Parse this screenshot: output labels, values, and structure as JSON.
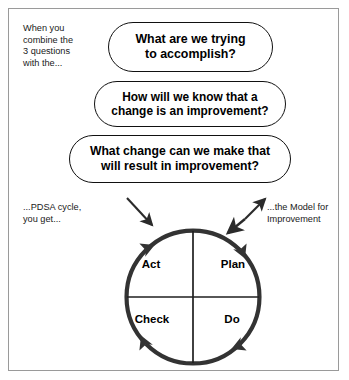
{
  "diagram": {
    "title_notes": {
      "intro": "When you\ncombine the\n3 questions\nwith the...",
      "pdsa": "...PDSA cycle,\nyou get...",
      "model": "...the Model for\nImprovement"
    },
    "questions": [
      {
        "id": "q1",
        "text": "What are we trying\nto accomplish?"
      },
      {
        "id": "q2",
        "text": "How will we know that a\nchange is an improvement?"
      },
      {
        "id": "q3",
        "text": "What change can we make that\nwill result in improvement?"
      }
    ],
    "cycle": {
      "name": "PDSA cycle",
      "direction": "clockwise",
      "quadrants": [
        {
          "position": "top-left",
          "label": "Act"
        },
        {
          "position": "top-right",
          "label": "Plan"
        },
        {
          "position": "bottom-left",
          "label": "Check"
        },
        {
          "position": "bottom-right",
          "label": "Do"
        }
      ]
    },
    "colors": {
      "frame_border": "#9a9a9a",
      "box_border": "#111111",
      "circle_stroke": "#333333",
      "text": "#000000",
      "background": "#ffffff"
    }
  }
}
